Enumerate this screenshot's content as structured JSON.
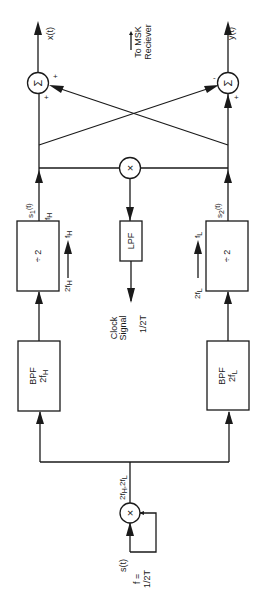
{
  "diagram": {
    "orientation": "rotated 90 degrees counter-clockwise",
    "colors": {
      "line": "#1a1a1a",
      "background": "#ffffff"
    },
    "input": {
      "signal": "s(t)",
      "freq_label": "f =",
      "freq_value": "1/2T"
    },
    "squarer": {
      "symbol": "×",
      "output_label_a": "2f",
      "output_label_a_sub": "H",
      "output_label_sep": ",2f",
      "output_label_b_sub": "L"
    },
    "bpf_high": {
      "name": "BPF",
      "freq": "2f",
      "freq_sub": "H"
    },
    "bpf_low": {
      "name": "BPF",
      "freq": "2f",
      "freq_sub": "L"
    },
    "div_high": {
      "name": "÷ 2",
      "in_label": "2f",
      "in_sub": "H",
      "out_label": "f",
      "out_sub": "H"
    },
    "div_low": {
      "name": "÷ 2",
      "in_label": "2f",
      "in_sub": "L",
      "out_label": "f",
      "out_sub": "L"
    },
    "s1": {
      "label": "s",
      "sub": "1",
      "suffix": "(t)",
      "freq": "f",
      "freq_sub": "H"
    },
    "s2": {
      "label": "s",
      "sub": "2",
      "suffix": "(t)"
    },
    "mixer": {
      "symbol": "×"
    },
    "lpf": {
      "name": "LPF"
    },
    "clock": {
      "line1": "Clock",
      "line2": "Signal",
      "freq": "1/2T"
    },
    "sum_top": {
      "symbol": "Σ",
      "sign_a": "+",
      "sign_b": "+",
      "output": "x(t)"
    },
    "sum_bottom": {
      "symbol": "Σ",
      "sign_a": "-",
      "sign_b": "+",
      "output": "y(t)"
    },
    "receiver_note": {
      "line1": "To MSK",
      "line2": "Reciever"
    }
  }
}
